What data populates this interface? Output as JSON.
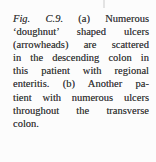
{
  "colors": {
    "background": "#fcfcfc",
    "text": "#3f3f3f",
    "artifact": "#dcdcdc"
  },
  "caption": {
    "line1_italic": "Fig. C.9.",
    "line1_rest": "(a) Numerous",
    "lines": [
      "‘doughnut’ shaped ulcers",
      "(arrowheads) are scattered",
      "in the descending colon in",
      "this patient with regional",
      "enteritis. (b) Another pa-",
      "tient with numerous ulcers",
      "throughout the transverse",
      "colon."
    ]
  }
}
